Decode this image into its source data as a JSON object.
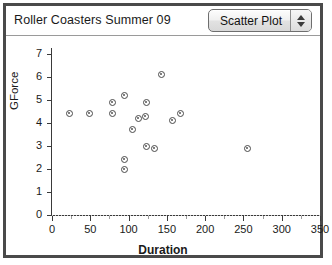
{
  "window": {
    "title": "Roller Coasters Summer 09"
  },
  "toolbar": {
    "plot_type_label": "Scatter Plot",
    "stepper_up_icon": "triangle-up-icon",
    "stepper_down_icon": "triangle-down-icon"
  },
  "chart_data": {
    "type": "scatter",
    "title": "Roller Coasters Summer 09",
    "xlabel": "Duration",
    "ylabel": "GForce",
    "xlim": [
      0,
      330
    ],
    "ylim": [
      0,
      7
    ],
    "xticks": [
      0,
      50,
      100,
      150,
      200,
      250,
      300,
      350
    ],
    "yticks": [
      0,
      1,
      2,
      3,
      4,
      5,
      6,
      7
    ],
    "grid": "horizontal-dotted-at-zero",
    "legend": null,
    "marker": "open-circle",
    "marker_color": "#4a4a4a",
    "points": [
      {
        "x": 23,
        "y": 4.4
      },
      {
        "x": 49,
        "y": 4.4
      },
      {
        "x": 79,
        "y": 4.9
      },
      {
        "x": 79,
        "y": 4.4
      },
      {
        "x": 95,
        "y": 5.2
      },
      {
        "x": 95,
        "y": 2.4
      },
      {
        "x": 95,
        "y": 2.0
      },
      {
        "x": 105,
        "y": 3.7
      },
      {
        "x": 123,
        "y": 4.9
      },
      {
        "x": 113,
        "y": 4.2
      },
      {
        "x": 122,
        "y": 4.3
      },
      {
        "x": 123,
        "y": 3.0
      },
      {
        "x": 143,
        "y": 6.1
      },
      {
        "x": 134,
        "y": 2.9
      },
      {
        "x": 157,
        "y": 4.1
      },
      {
        "x": 168,
        "y": 4.4
      },
      {
        "x": 255,
        "y": 2.9
      }
    ]
  }
}
